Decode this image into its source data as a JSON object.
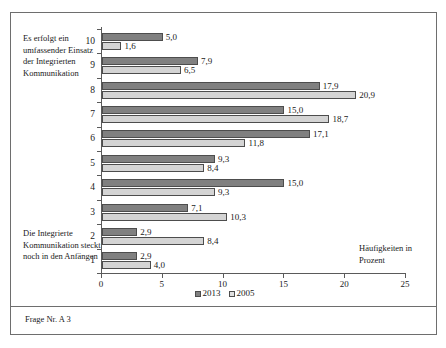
{
  "figure": {
    "footer_caption": "Frage Nr. A 3",
    "note_top": "Es erfolgt ein umfassender Einsatz der Integrierten Kommunikation",
    "note_bottom": "Die Integrierte Kommunikation steckt noch in den Anfängen",
    "axis_title": "Häufigkeiten in Prozent"
  },
  "chart_data": {
    "type": "bar",
    "orientation": "horizontal",
    "title": "",
    "xlabel": "Häufigkeiten in Prozent",
    "ylabel": "",
    "xlim": [
      0,
      25
    ],
    "xticks": [
      0,
      5,
      10,
      15,
      20,
      25
    ],
    "xtick_labels": [
      "0",
      "5",
      "10",
      "15",
      "20",
      "25"
    ],
    "categories": [
      "1",
      "2",
      "3",
      "4",
      "5",
      "6",
      "7",
      "8",
      "9",
      "10"
    ],
    "category_order_top_to_bottom": [
      "10",
      "9",
      "8",
      "7",
      "6",
      "5",
      "4",
      "3",
      "2",
      "1"
    ],
    "grid": false,
    "legend_position": "bottom",
    "series": [
      {
        "name": "2013",
        "color": "#808080",
        "values": [
          2.9,
          2.9,
          7.1,
          15.0,
          9.3,
          17.1,
          15.0,
          17.9,
          7.9,
          5.0
        ],
        "labels": [
          "2,9",
          "2,9",
          "7,1",
          "15,0",
          "9,3",
          "17,1",
          "15,0",
          "17,9",
          "7,9",
          "5,0"
        ]
      },
      {
        "name": "2005",
        "color": "#d4d4d4",
        "values": [
          4.0,
          8.4,
          10.3,
          9.3,
          8.4,
          11.8,
          18.7,
          20.9,
          6.5,
          1.6
        ],
        "labels": [
          "4,0",
          "8,4",
          "10,3",
          "9,3",
          "8,4",
          "11,8",
          "18,7",
          "20,9",
          "6,5",
          "1,6"
        ]
      }
    ]
  },
  "legend": {
    "items": [
      {
        "label": "2013"
      },
      {
        "label": "2005"
      }
    ]
  }
}
